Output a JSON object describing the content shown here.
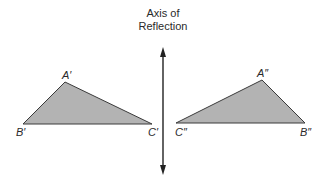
{
  "title": {
    "line1": "Axis of",
    "line2": "Reflection"
  },
  "colors": {
    "fill": "#b3b3b3",
    "stroke": "#3a3a3a",
    "axis": "#222222"
  },
  "left_triangle": {
    "vertices": {
      "A": {
        "label": "A′",
        "x": 65,
        "y": 82
      },
      "B": {
        "label": "B′",
        "x": 23,
        "y": 124
      },
      "C": {
        "label": "C′",
        "x": 152,
        "y": 124
      }
    }
  },
  "right_triangle": {
    "vertices": {
      "A": {
        "label": "A″",
        "x": 262,
        "y": 80
      },
      "B": {
        "label": "B″",
        "x": 305,
        "y": 123
      },
      "C": {
        "label": "C″",
        "x": 176,
        "y": 123
      }
    }
  },
  "axis": {
    "x": 163,
    "y_top": 48,
    "y_bottom": 174
  }
}
